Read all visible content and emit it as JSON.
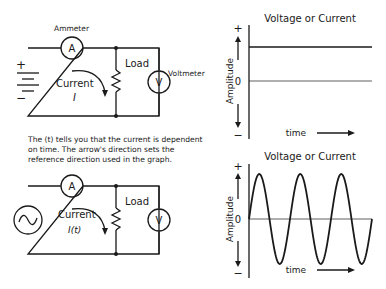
{
  "dc_circuit": {
    "ammeter_label": "Ammeter",
    "ammeter_symbol": "A",
    "load_label": "Load",
    "voltmeter_label": "Voltmeter",
    "voltmeter_symbol": "V",
    "current_label": "Current",
    "current_symbol": "I",
    "plus_sign": "+",
    "minus_sign": "−",
    "source_icon": "battery-icon"
  },
  "caption": "The (t) tells you that the current is dependent on time.  The arrow's direction sets the reference direction used in the graph.",
  "ac_circuit": {
    "ammeter_symbol": "A",
    "load_label": "Load",
    "voltmeter_symbol": "V",
    "current_label": "Current",
    "current_symbol": "I(t)",
    "source_icon": "ac-source-icon"
  },
  "chart_data": [
    {
      "type": "line",
      "title": "Voltage or Current",
      "xlabel": "time",
      "ylabel": "Amplitude",
      "y_ticks": [
        "+",
        "0",
        "−"
      ],
      "series": [
        {
          "name": "DC",
          "shape": "constant",
          "level": 0.55
        }
      ],
      "grid": false
    },
    {
      "type": "line",
      "title": "Voltage or Current",
      "xlabel": "time",
      "ylabel": "Amplitude",
      "y_ticks": [
        "+",
        "0",
        "−"
      ],
      "series": [
        {
          "name": "AC",
          "shape": "sine",
          "cycles": 3,
          "amplitude": 0.85
        }
      ],
      "grid": false
    }
  ]
}
